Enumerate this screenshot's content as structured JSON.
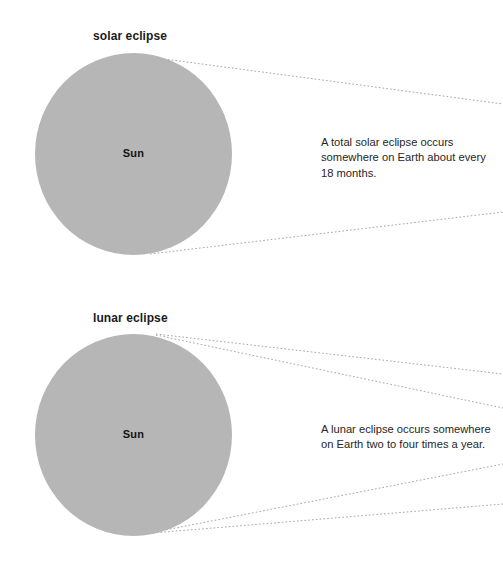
{
  "page": {
    "background_color": "#ffffff",
    "width": 503,
    "height": 564
  },
  "colors": {
    "sun_fill": "#b6b6b6",
    "title_text": "#1b1b1b",
    "body_text": "#262626",
    "ray_line": "#9a9a9a"
  },
  "panels": [
    {
      "id": "solar",
      "title": "solar eclipse",
      "sun_label": "Sun",
      "caption": "A total solar eclipse occurs somewhere on Earth about every 18 months.",
      "rays": [
        {
          "name": "ray-solar-top",
          "x1": 149,
          "y1": 57,
          "x2": 503,
          "y2": 104
        },
        {
          "name": "ray-solar-bottom",
          "x1": 150,
          "y1": 254,
          "x2": 503,
          "y2": 212
        }
      ]
    },
    {
      "id": "lunar",
      "title": "lunar eclipse",
      "sun_label": "Sun",
      "caption": "A lunar eclipse occurs somewhere on Earth two to four times a year.",
      "rays": [
        {
          "name": "ray-lunar-top-upper",
          "x1": 156,
          "y1": 52,
          "x2": 503,
          "y2": 92
        },
        {
          "name": "ray-lunar-top-lower",
          "x1": 156,
          "y1": 53,
          "x2": 503,
          "y2": 126
        },
        {
          "name": "ray-lunar-bot-upper",
          "x1": 155,
          "y1": 250,
          "x2": 503,
          "y2": 182
        },
        {
          "name": "ray-lunar-bot-lower",
          "x1": 153,
          "y1": 251,
          "x2": 503,
          "y2": 222
        }
      ]
    }
  ]
}
